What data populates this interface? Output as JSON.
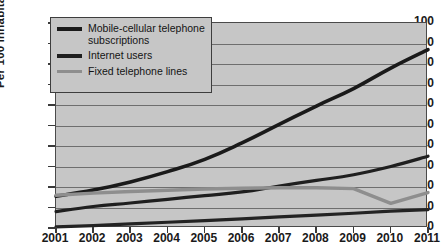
{
  "chart_data": {
    "type": "line",
    "title": "",
    "subtitle": "",
    "xlabel": "",
    "ylabel": "Per 100 inhabitants",
    "x": [
      2001,
      2002,
      2003,
      2004,
      2005,
      2006,
      2007,
      2008,
      2009,
      2010,
      2011
    ],
    "xtick_labels": [
      "2001",
      "2002",
      "2003",
      "2004",
      "2005",
      "2006",
      "2007",
      "2008",
      "2009",
      "2010",
      "2011"
    ],
    "ytick_labels": [
      "0",
      "10",
      "20",
      "30",
      "40",
      "50",
      "60",
      "70",
      "80",
      "90",
      "100"
    ],
    "yticks": [
      0,
      10,
      20,
      30,
      40,
      50,
      60,
      70,
      80,
      90,
      100
    ],
    "ylim": [
      0,
      100
    ],
    "xlim": [
      2001,
      2011
    ],
    "grid": true,
    "legend_position": "top-left",
    "plot_background": "#c6c6c6",
    "series": [
      {
        "name": "Mobile-cellular telephone subscriptions",
        "legend_label": "Mobile-cellular telephone\nsubscriptions",
        "color": "#1a1a1a",
        "width": 3.6,
        "values": [
          15.5,
          18.5,
          22.5,
          27.5,
          33.5,
          41.5,
          50.5,
          59.5,
          68.0,
          78.0,
          87.0
        ]
      },
      {
        "name": "Internet users",
        "legend_label": "Internet users",
        "color": "#1f1f1f",
        "width": 3.2,
        "values": [
          8.0,
          10.5,
          12.2,
          14.0,
          15.8,
          17.6,
          20.5,
          23.2,
          26.0,
          30.0,
          35.0
        ]
      },
      {
        "name": "Fixed telephone lines",
        "legend_label": "Fixed telephone lines",
        "color": "#8e8e8e",
        "width": 3.4,
        "values": [
          16.0,
          17.0,
          17.8,
          18.4,
          19.0,
          19.4,
          19.6,
          19.6,
          19.2,
          12.0,
          17.3
        ]
      },
      {
        "name": "Lower trend line",
        "legend_label": "",
        "color": "#232323",
        "width": 3.2,
        "values": [
          0.5,
          1.2,
          2.0,
          2.8,
          3.6,
          4.5,
          5.4,
          6.3,
          7.2,
          8.2,
          9.0
        ]
      }
    ]
  },
  "axes": {
    "y_title": "Per 100 inhabitants"
  }
}
